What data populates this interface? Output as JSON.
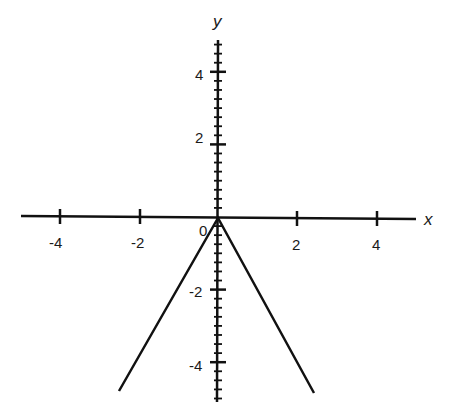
{
  "chart_data": {
    "type": "line",
    "title": "",
    "xlabel": "x",
    "ylabel": "y",
    "xlim": [
      -5,
      5
    ],
    "ylim": [
      -5,
      5
    ],
    "grid": false,
    "x_ticks": [
      -4,
      -2,
      0,
      2,
      4
    ],
    "x_tick_labels": [
      "-4",
      "-2",
      "0",
      "2",
      "4"
    ],
    "y_ticks": [
      -4,
      -2,
      2,
      4
    ],
    "y_tick_labels": [
      "-4",
      "-2",
      "2",
      "4"
    ],
    "origin_label": "0",
    "series": [
      {
        "name": "y = -2|x|",
        "x": [
          -2.5,
          0,
          2.5
        ],
        "y": [
          -4.8,
          0,
          -4.8
        ]
      }
    ]
  },
  "caption": ""
}
